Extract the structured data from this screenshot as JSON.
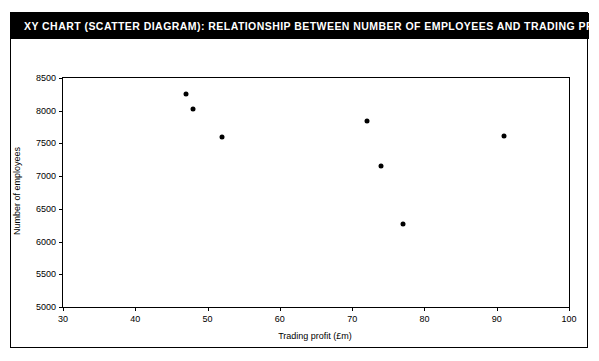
{
  "title": "XY CHART (SCATTER DIAGRAM): RELATIONSHIP BETWEEN NUMBER OF EMPLOYEES AND TRADING PROFIT",
  "colors": {
    "title_bar_background": "#000000",
    "title_text": "#ffffff",
    "axis": "#000000",
    "marker": "#000000",
    "plot_background": "#ffffff"
  },
  "chart_data": {
    "type": "scatter",
    "title": "XY CHART (SCATTER DIAGRAM): RELATIONSHIP BETWEEN NUMBER OF EMPLOYEES AND TRADING PROFIT",
    "xlabel": "Trading profit (£m)",
    "ylabel": "Number of employees",
    "xlim": [
      30,
      100
    ],
    "ylim": [
      5000,
      8500
    ],
    "xticks": [
      30,
      40,
      50,
      60,
      70,
      80,
      90,
      100
    ],
    "xtick_labels": [
      "30",
      "40",
      "50",
      "60",
      "70",
      "80",
      "90",
      "100"
    ],
    "yticks": [
      5000,
      5500,
      6000,
      6500,
      7000,
      7500,
      8000,
      8500
    ],
    "ytick_labels": [
      "5000",
      "5500",
      "6000",
      "6500",
      "7000",
      "7500",
      "8000",
      "8500"
    ],
    "grid": false,
    "legend": null,
    "marker": "filled-circle",
    "points": [
      {
        "x": 47,
        "y": 8250
      },
      {
        "x": 48,
        "y": 8030
      },
      {
        "x": 52,
        "y": 7600
      },
      {
        "x": 72,
        "y": 7850
      },
      {
        "x": 74,
        "y": 7150
      },
      {
        "x": 77,
        "y": 6270
      },
      {
        "x": 91,
        "y": 7620
      }
    ]
  }
}
